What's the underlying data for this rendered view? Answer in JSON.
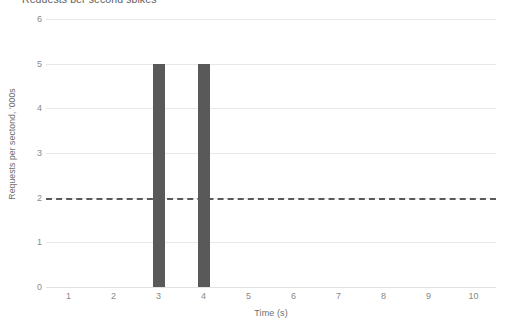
{
  "chart_data": {
    "type": "bar",
    "title": "Requests per second spikes",
    "categories": [
      "1",
      "2",
      "3",
      "4",
      "5",
      "6",
      "7",
      "8",
      "9",
      "10"
    ],
    "values": [
      0,
      0,
      5,
      0,
      0,
      0,
      0,
      0,
      0,
      0
    ],
    "series": [
      {
        "name": "Requests",
        "values": [
          0,
          0,
          5,
          5,
          0,
          0,
          0,
          0,
          0,
          0
        ]
      }
    ],
    "xlabel": "Time (s)",
    "ylabel": "Requests per sectond, '000s",
    "ylim": [
      0,
      6
    ],
    "yticks": [
      "0",
      "1",
      "2",
      "3",
      "4",
      "5",
      "6"
    ],
    "ytick_values": [
      0,
      1,
      2,
      3,
      4,
      5,
      6
    ],
    "grid": true,
    "legend": false,
    "annotations": [
      {
        "type": "threshold-line",
        "style": "dashed",
        "value": 2,
        "label": ""
      }
    ],
    "colors": {
      "bar": "#595959",
      "threshold": "#595959",
      "gridline": "#e8e8e8",
      "axis_text": "#8a8a8a",
      "background": "#ffffff"
    }
  }
}
